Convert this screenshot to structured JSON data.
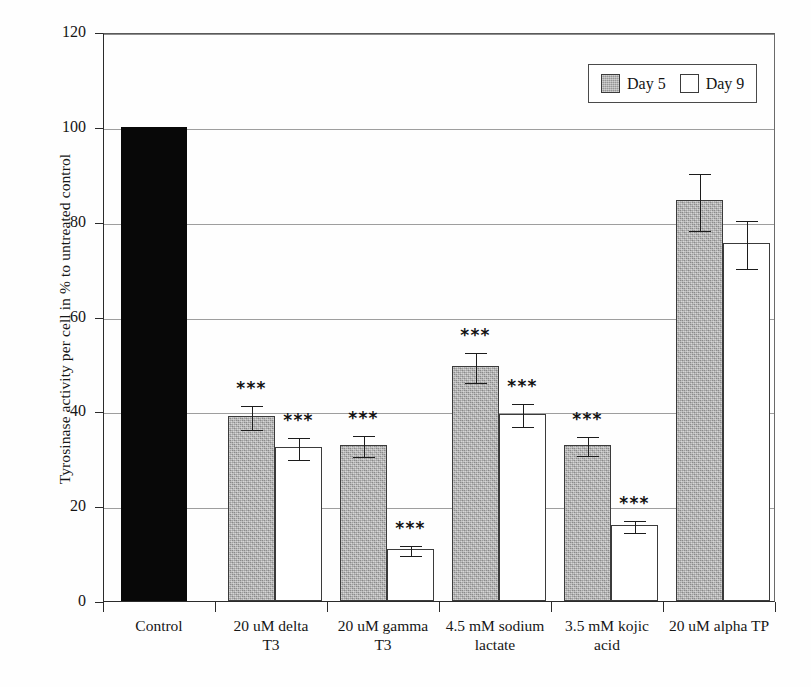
{
  "chart_data": {
    "type": "bar",
    "title": "",
    "xlabel": "",
    "ylabel": "Tyrosinase activity per cell in % to untreated control",
    "ylim": [
      0,
      120
    ],
    "yticks": [
      0,
      20,
      40,
      60,
      80,
      100,
      120
    ],
    "grid": true,
    "legend_position": "top-right",
    "legend": [
      "Day 5",
      "Day 9"
    ],
    "categories": [
      "Control",
      "20 uM delta T3",
      "20 uM gamma T3",
      "4.5 mM sodium lactate",
      "3.5 mM kojic acid",
      "20 uM alpha TP"
    ],
    "category_lines": [
      [
        "Control",
        ""
      ],
      [
        "20 uM delta",
        "T3"
      ],
      [
        "20 uM gamma",
        "T3"
      ],
      [
        "4.5 mM sodium",
        "lactate"
      ],
      [
        "3.5 mM kojic",
        "acid"
      ],
      [
        "20 uM alpha TP",
        ""
      ]
    ],
    "series": [
      {
        "name": "Day 5",
        "values": [
          100,
          39,
          33,
          49.5,
          33,
          84.5
        ],
        "errors": [
          0,
          2.6,
          2.2,
          3.2,
          2.0,
          6.0
        ],
        "significance": [
          "",
          "***",
          "***",
          "***",
          "***",
          ""
        ]
      },
      {
        "name": "Day 9",
        "values": [
          null,
          32.5,
          11,
          39.5,
          16,
          75.5
        ],
        "errors": [
          0,
          2.4,
          1.0,
          2.4,
          1.2,
          5.0
        ],
        "significance": [
          "",
          "***",
          "***",
          "***",
          "***",
          ""
        ]
      }
    ],
    "control_series": {
      "name": "Control",
      "value": 100,
      "color": "#080808"
    },
    "colors": {
      "day5_fill": "#a9a9a9",
      "day9_fill": "#ffffff",
      "control_fill": "#080808",
      "axis": "#2b2b2b",
      "grid": "#8d8d8d"
    }
  }
}
